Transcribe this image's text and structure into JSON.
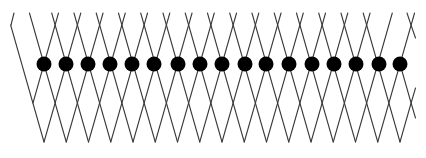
{
  "diagram": {
    "title": "",
    "description": "Lattice of crossing diagonal threads with a horizontal row of black beads at the crossing points",
    "canvas": {
      "width": 426,
      "height": 158,
      "background": "#ffffff"
    },
    "colors": {
      "thread": "#3a3a3a",
      "bead": "#000000"
    },
    "geometry": {
      "bead_count": 17,
      "bead_row_y": 64,
      "bead_radius": 7.5,
      "first_bead_x": 44,
      "pitch": 22.25,
      "top_y": 13,
      "upper_cross_y": 25,
      "lower_cross_y": 103,
      "bottom_y": 142
    },
    "beads_x": [
      44,
      66,
      88,
      110,
      132,
      154,
      178,
      200,
      222,
      245,
      266,
      289,
      312,
      334,
      356,
      379,
      400
    ],
    "edge_segments": [
      [
        [
          11,
          25
        ],
        [
          14,
          13
        ]
      ],
      [
        [
          33,
          103
        ],
        [
          44,
          64
        ],
        [
          55.1,
          25
        ],
        [
          58.5,
          13
        ]
      ],
      [
        [
          407,
          13
        ],
        [
          411,
          25
        ],
        [
          415.5,
          38
        ]
      ],
      [
        [
          400,
          142
        ],
        [
          411.1,
          103
        ],
        [
          415.5,
          88
        ]
      ],
      [
        [
          400,
          64
        ],
        [
          411.1,
          103
        ],
        [
          415.5,
          118
        ]
      ]
    ]
  }
}
